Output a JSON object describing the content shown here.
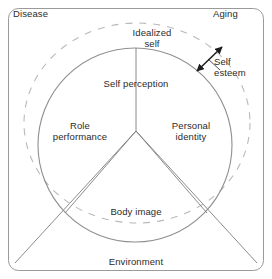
{
  "diagram": {
    "frame": {
      "label_top_left": "Disease",
      "label_top_right": "Aging",
      "label_bottom": "Environment",
      "stroke_color": "#9a9a9a"
    },
    "outer_ellipse": {
      "label": "Idealized\nself",
      "style": "dashed",
      "stroke_color": "#b4b4b4"
    },
    "inner_circle": {
      "label_top": "Self perception",
      "style": "solid",
      "stroke_color": "#8f8f8f",
      "sectors": [
        {
          "name": "role-performance",
          "label": "Role\nperformance"
        },
        {
          "name": "personal-identity",
          "label": "Personal\nidentity"
        },
        {
          "name": "body-image",
          "label": "Body image"
        }
      ]
    },
    "annotation": {
      "label": "Self\nesteem",
      "arrow": "double-headed",
      "arrow_color": "#1e1e1e"
    },
    "colors": {
      "text": "#2b2b2b",
      "frame_line": "#9a9a9a",
      "circle_line": "#8f8f8f",
      "dashed_line": "#b4b4b4",
      "divider_line": "#7d7d7d",
      "background": "#ffffff"
    }
  }
}
